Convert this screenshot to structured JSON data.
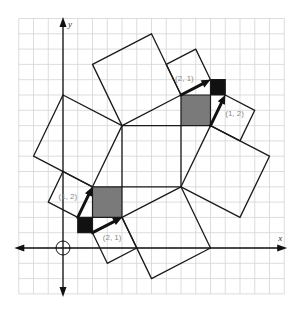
{
  "diagram": {
    "type": "lattice-square-tiling",
    "axes": {
      "x_label": "x",
      "y_label": "y",
      "origin_marker": "circle",
      "grid_range": {
        "xmin": -3,
        "xmax": 15,
        "ymin": -3,
        "ymax": 15
      }
    },
    "colors": {
      "grid": "#d4d4d4",
      "line": "#1a1a1a",
      "gray_fill": "#7a7a7a",
      "black_fill": "#111111",
      "label": "#8a8a8a"
    },
    "central_square": [
      [
        4,
        4
      ],
      [
        8,
        4
      ],
      [
        8,
        8
      ],
      [
        4,
        8
      ]
    ],
    "filled_squares": [
      {
        "name": "lower-gray-square",
        "fill": "gray",
        "points": [
          [
            2,
            2
          ],
          [
            4,
            2
          ],
          [
            4,
            4
          ],
          [
            2,
            4
          ]
        ]
      },
      {
        "name": "lower-black-square",
        "fill": "black",
        "points": [
          [
            1,
            1
          ],
          [
            2,
            1
          ],
          [
            2,
            2
          ],
          [
            1,
            2
          ]
        ]
      },
      {
        "name": "upper-gray-square",
        "fill": "gray",
        "points": [
          [
            8,
            8
          ],
          [
            10,
            8
          ],
          [
            10,
            10
          ],
          [
            8,
            10
          ]
        ]
      },
      {
        "name": "upper-black-square",
        "fill": "black",
        "points": [
          [
            10,
            10
          ],
          [
            11,
            10
          ],
          [
            11,
            11
          ],
          [
            10,
            11
          ]
        ]
      }
    ],
    "tilted_squares": [
      {
        "name": "left-large-square",
        "points": [
          [
            0,
            10
          ],
          [
            4,
            8
          ],
          [
            2,
            4
          ],
          [
            -2,
            6
          ]
        ]
      },
      {
        "name": "top-large-square",
        "points": [
          [
            4,
            8
          ],
          [
            2,
            12
          ],
          [
            6,
            14
          ],
          [
            8,
            10
          ]
        ]
      },
      {
        "name": "right-large-square",
        "points": [
          [
            8,
            4
          ],
          [
            12,
            2
          ],
          [
            14,
            6
          ],
          [
            10,
            8
          ]
        ]
      },
      {
        "name": "bottom-large-square",
        "points": [
          [
            4,
            2
          ],
          [
            8,
            4
          ],
          [
            10,
            0
          ],
          [
            6,
            -2
          ]
        ]
      },
      {
        "name": "left-small-square",
        "points": [
          [
            2,
            4
          ],
          [
            0,
            5
          ],
          [
            -1,
            3
          ],
          [
            1,
            2
          ]
        ]
      },
      {
        "name": "bottom-small-square",
        "points": [
          [
            4,
            2
          ],
          [
            5,
            0
          ],
          [
            3,
            -1
          ],
          [
            2,
            1
          ]
        ]
      },
      {
        "name": "top-small-square",
        "points": [
          [
            8,
            10
          ],
          [
            7,
            12
          ],
          [
            9,
            13
          ],
          [
            10,
            11
          ]
        ]
      },
      {
        "name": "right-small-square",
        "points": [
          [
            10,
            8
          ],
          [
            11,
            10
          ],
          [
            13,
            9
          ],
          [
            12,
            7
          ]
        ]
      }
    ],
    "vectors": [
      {
        "name": "lower-vector-1-2",
        "label": "(1, 2)",
        "from": [
          1,
          2
        ],
        "to": [
          2,
          4
        ],
        "label_pos": [
          -0.3,
          3.2
        ]
      },
      {
        "name": "lower-vector-2-1",
        "label": "(2, 1)",
        "from": [
          2,
          1
        ],
        "to": [
          4,
          2
        ],
        "label_pos": [
          2.7,
          0.55
        ]
      },
      {
        "name": "upper-vector-2-1",
        "label": "(2, 1)",
        "from": [
          8,
          10
        ],
        "to": [
          10,
          11
        ],
        "label_pos": [
          7.6,
          10.9
        ]
      },
      {
        "name": "upper-vector-1-2",
        "label": "(1, 2)",
        "from": [
          10,
          8
        ],
        "to": [
          11,
          10
        ],
        "label_pos": [
          11.0,
          8.6
        ]
      }
    ]
  }
}
